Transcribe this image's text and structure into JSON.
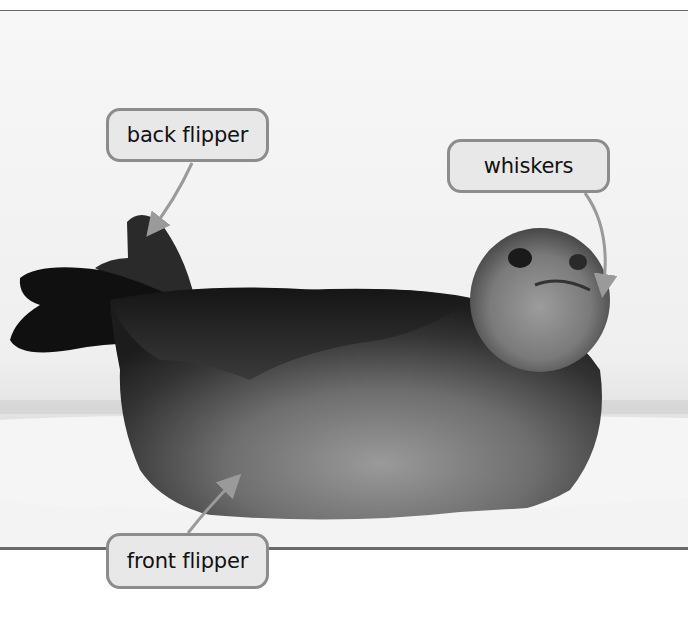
{
  "figure": {
    "colors": {
      "frame_rule": "#6a6a6a",
      "callout_fill": "#e8e8e8",
      "callout_border": "#8c8c8c",
      "leader_line": "#8c8c8c",
      "label_text": "#111111",
      "snow": "#f4f4f4",
      "seal_dark": "#1a1a1a",
      "seal_light": "#8a8a8a"
    }
  },
  "labels": {
    "back_flipper": "back flipper",
    "whiskers": "whiskers",
    "front_flipper": "front flipper"
  }
}
